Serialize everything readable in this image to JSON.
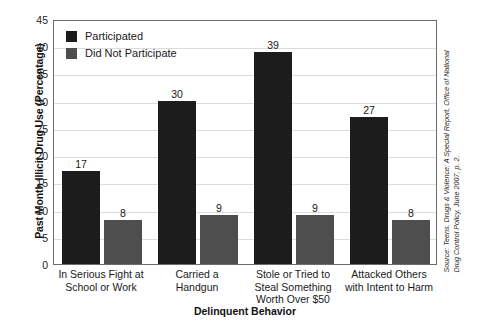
{
  "chart_data": {
    "type": "bar",
    "title": "",
    "xlabel": "Delinquent Behavior",
    "ylabel": "Past Month Illicit Drug Use (Percentage)",
    "ylim": [
      0,
      45
    ],
    "y_ticks": [
      0,
      5,
      10,
      15,
      20,
      25,
      30,
      35,
      40,
      45
    ],
    "grid": true,
    "legend_position": "top-left",
    "categories": [
      "In Serious Fight at School or Work",
      "Carried a Handgun",
      "Stole or Tried to Steal Something Worth Over $50",
      "Attacked Others with Intent to Harm"
    ],
    "category_lines": [
      [
        "In Serious Fight at",
        "School or Work"
      ],
      [
        "Carried a",
        "Handgun"
      ],
      [
        "Stole or Tried to",
        "Steal Something",
        "Worth Over $50"
      ],
      [
        "Attacked Others",
        "with Intent to Harm"
      ]
    ],
    "series": [
      {
        "name": "Participated",
        "color": "#1c1c1c",
        "values": [
          17,
          30,
          39,
          27
        ]
      },
      {
        "name": "Did Not Participate",
        "color": "#4e4e4e",
        "values": [
          8,
          9,
          9,
          8
        ]
      }
    ]
  },
  "legend": {
    "items": [
      {
        "label": "Participated"
      },
      {
        "label": "Did Not Participate"
      }
    ]
  },
  "source": {
    "line1": "Source: Teens, Drugs & Violence: A Special Report, Office of National",
    "line2": "Drug Control Policy, June 2007, p. 2."
  },
  "colors": {
    "participated": "#1c1c1c",
    "did_not_participate": "#4e4e4e",
    "gridline": "#dcdcdc",
    "frame": "#6d6d6d",
    "background": "#ffffff"
  }
}
